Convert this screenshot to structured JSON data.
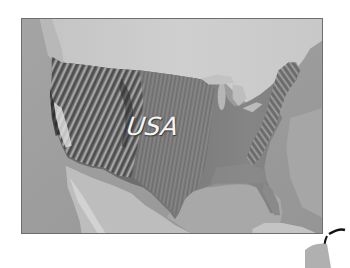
{
  "map": {
    "label": "USA",
    "style": "grayscale shaded relief",
    "colors": {
      "frame_border": "#6e6e6e",
      "ocean": "#9a9a9a",
      "canada_land": "#c9c9c9",
      "mexico_land": "#bdbdbd",
      "gulf": "#a9a9a9",
      "usa_land": "#7a7a7a",
      "label": "#f4f4f4"
    }
  }
}
